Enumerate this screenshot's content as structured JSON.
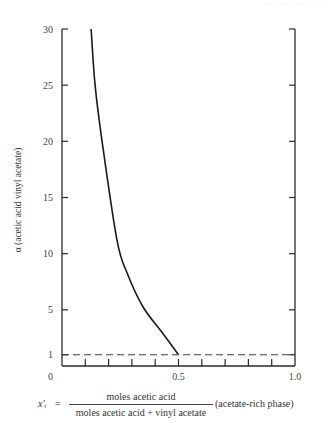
{
  "header": {
    "faint_text": "· · · · · · · · · · · ·"
  },
  "chart_data": {
    "type": "line",
    "title": "",
    "xlabel": "x'ᵢ = moles acetic acid / (moles acetic acid + vinyl acetate) (acetate-rich phase)",
    "ylabel": "α (acetic acid vinyl acetate)",
    "xlim": [
      0,
      1.0
    ],
    "ylim": [
      0,
      30
    ],
    "x_tick_labels": [
      "0",
      "0.5",
      "1.0"
    ],
    "x_tick_values": [
      0,
      0.5,
      1.0
    ],
    "x_minor_ticks": [
      0.1,
      0.2,
      0.3,
      0.4,
      0.5,
      0.6,
      0.7,
      0.8,
      0.9
    ],
    "y_tick_labels": [
      "0",
      "1",
      "5",
      "10",
      "15",
      "20",
      "25",
      "30"
    ],
    "y_tick_values": [
      0,
      1,
      5,
      10,
      15,
      20,
      25,
      30
    ],
    "grid": false,
    "legend": null,
    "series": [
      {
        "name": "alpha curve",
        "style": "solid",
        "color": "#1a1a1a",
        "x": [
          0.125,
          0.142,
          0.172,
          0.236,
          0.279,
          0.348,
          0.433,
          0.5
        ],
        "y": [
          30,
          25,
          20,
          11.2,
          8.3,
          5.25,
          2.9,
          1.0
        ]
      },
      {
        "name": "alpha = 1 reference",
        "style": "dashed",
        "color": "#3a3a6a",
        "x": [
          0,
          1.0
        ],
        "y": [
          1,
          1
        ]
      }
    ]
  },
  "labels": {
    "y_axis": "α (acetic acid vinyl acetate)",
    "x_lhs": "x'ᵢ",
    "x_eq": "=",
    "x_numerator": "moles acetic acid",
    "x_denominator": "moles acetic acid  +  vinyl acetate",
    "x_phase": "(acetate-rich phase)"
  },
  "ticks": {
    "y": [
      "30",
      "25",
      "20",
      "15",
      "10",
      "5",
      "1",
      "0"
    ],
    "x": [
      "0",
      "0.5",
      "1.0"
    ]
  }
}
